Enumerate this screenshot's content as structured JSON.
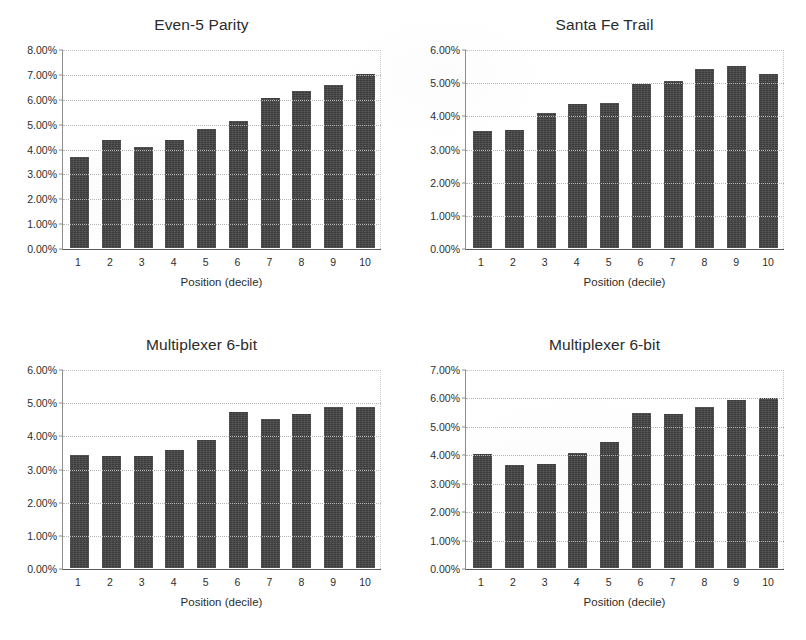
{
  "figure": {
    "background_color": "#ffffff",
    "bar_color": "#3b3b3b",
    "gridline_color": "#b6b6b6",
    "axis_color": "#5a5a5a"
  },
  "charts": [
    {
      "id": "even-5-parity",
      "title": "Even-5 Parity",
      "xlabel": "Position (decile)",
      "ylabel": "",
      "ytick_labels": [
        "0.00%",
        "1.00%",
        "2.00%",
        "3.00%",
        "4.00%",
        "5.00%",
        "6.00%",
        "7.00%",
        "8.00%"
      ],
      "xtick_labels": [
        "1",
        "2",
        "3",
        "4",
        "5",
        "6",
        "7",
        "8",
        "9",
        "10"
      ]
    },
    {
      "id": "santa-fe-trail",
      "title": "Santa Fe Trail",
      "xlabel": "Position (decile)",
      "ylabel": "",
      "ytick_labels": [
        "0.00%",
        "1.00%",
        "2.00%",
        "3.00%",
        "4.00%",
        "5.00%",
        "6.00%"
      ],
      "xtick_labels": [
        "1",
        "2",
        "3",
        "4",
        "5",
        "6",
        "7",
        "8",
        "9",
        "10"
      ]
    },
    {
      "id": "multiplexer-6-bit-a",
      "title": "Multiplexer 6-bit",
      "xlabel": "Position (decile)",
      "ylabel": "",
      "ytick_labels": [
        "0.00%",
        "1.00%",
        "2.00%",
        "3.00%",
        "4.00%",
        "5.00%",
        "6.00%"
      ],
      "xtick_labels": [
        "1",
        "2",
        "3",
        "4",
        "5",
        "6",
        "7",
        "8",
        "9",
        "10"
      ]
    },
    {
      "id": "multiplexer-6-bit-b",
      "title": "Multiplexer 6-bit",
      "xlabel": "Position (decile)",
      "ylabel": "",
      "ytick_labels": [
        "0.00%",
        "1.00%",
        "2.00%",
        "3.00%",
        "4.00%",
        "5.00%",
        "6.00%",
        "7.00%"
      ],
      "xtick_labels": [
        "1",
        "2",
        "3",
        "4",
        "5",
        "6",
        "7",
        "8",
        "9",
        "10"
      ]
    }
  ],
  "chart_data": [
    {
      "type": "bar",
      "title": "Even-5 Parity",
      "xlabel": "Position (decile)",
      "ylabel": "",
      "categories": [
        "1",
        "2",
        "3",
        "4",
        "5",
        "6",
        "7",
        "8",
        "9",
        "10"
      ],
      "values": [
        3.68,
        4.37,
        4.1,
        4.35,
        4.8,
        5.15,
        6.08,
        6.33,
        6.6,
        7.02
      ],
      "value_unit": "percent",
      "ylim": [
        0,
        8
      ],
      "ytick_values": [
        0,
        1,
        2,
        3,
        4,
        5,
        6,
        7,
        8
      ],
      "ytick_labels": [
        "0.00%",
        "1.00%",
        "2.00%",
        "3.00%",
        "4.00%",
        "5.00%",
        "6.00%",
        "7.00%",
        "8.00%"
      ],
      "grid": true,
      "legend": false
    },
    {
      "type": "bar",
      "title": "Santa Fe Trail",
      "xlabel": "Position (decile)",
      "ylabel": "",
      "categories": [
        "1",
        "2",
        "3",
        "4",
        "5",
        "6",
        "7",
        "8",
        "9",
        "10"
      ],
      "values": [
        3.55,
        3.58,
        4.1,
        4.35,
        4.38,
        4.97,
        5.05,
        5.42,
        5.53,
        5.27
      ],
      "value_unit": "percent",
      "ylim": [
        0,
        6
      ],
      "ytick_values": [
        0,
        1,
        2,
        3,
        4,
        5,
        6
      ],
      "ytick_labels": [
        "0.00%",
        "1.00%",
        "2.00%",
        "3.00%",
        "4.00%",
        "5.00%",
        "6.00%"
      ],
      "grid": true,
      "legend": false
    },
    {
      "type": "bar",
      "title": "Multiplexer 6-bit",
      "xlabel": "Position (decile)",
      "ylabel": "",
      "categories": [
        "1",
        "2",
        "3",
        "4",
        "5",
        "6",
        "7",
        "8",
        "9",
        "10"
      ],
      "values": [
        3.42,
        3.38,
        3.4,
        3.58,
        3.88,
        4.73,
        4.52,
        4.67,
        4.89,
        4.89
      ],
      "value_unit": "percent",
      "ylim": [
        0,
        6
      ],
      "ytick_values": [
        0,
        1,
        2,
        3,
        4,
        5,
        6
      ],
      "ytick_labels": [
        "0.00%",
        "1.00%",
        "2.00%",
        "3.00%",
        "4.00%",
        "5.00%",
        "6.00%"
      ],
      "grid": true,
      "legend": false
    },
    {
      "type": "bar",
      "title": "Multiplexer 6-bit",
      "xlabel": "Position (decile)",
      "ylabel": "",
      "categories": [
        "1",
        "2",
        "3",
        "4",
        "5",
        "6",
        "7",
        "8",
        "9",
        "10"
      ],
      "values": [
        4.02,
        3.65,
        3.68,
        4.07,
        4.44,
        5.47,
        5.43,
        5.69,
        5.95,
        6.0
      ],
      "value_unit": "percent",
      "ylim": [
        0,
        7
      ],
      "ytick_values": [
        0,
        1,
        2,
        3,
        4,
        5,
        6,
        7
      ],
      "ytick_labels": [
        "0.00%",
        "1.00%",
        "2.00%",
        "3.00%",
        "4.00%",
        "5.00%",
        "6.00%",
        "7.00%"
      ],
      "grid": true,
      "legend": false
    }
  ]
}
